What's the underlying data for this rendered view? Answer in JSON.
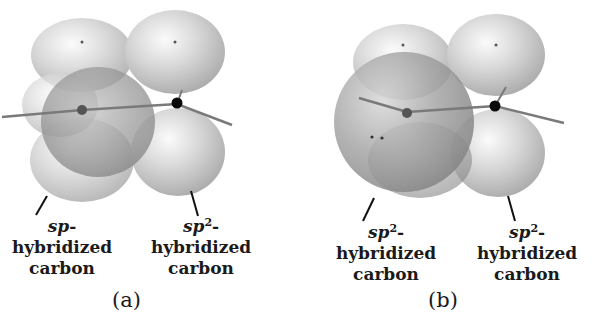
{
  "figure": {
    "panels": [
      {
        "id": "a",
        "letter": "(a)",
        "left_label": {
          "prefix": "sp",
          "superscript": "",
          "suffix": "-hybridized",
          "line2": "carbon"
        },
        "right_label": {
          "prefix": "sp",
          "superscript": "2",
          "suffix": "-hybridized",
          "line2": "carbon"
        }
      },
      {
        "id": "b",
        "letter": "(b)",
        "left_label": {
          "prefix": "sp",
          "superscript": "2",
          "suffix": "-hybridized",
          "line2": "carbon"
        },
        "right_label": {
          "prefix": "sp",
          "superscript": "2",
          "suffix": "-hybridized",
          "line2": "carbon"
        }
      }
    ],
    "colors": {
      "lobe_light": "#f4f4f4",
      "lobe_mid": "#c8c8c8",
      "lobe_dark": "#8e8e8e",
      "atom_black": "#0a0a0a",
      "atom_gray": "#555555",
      "bond_line": "#7a7a7a"
    }
  }
}
